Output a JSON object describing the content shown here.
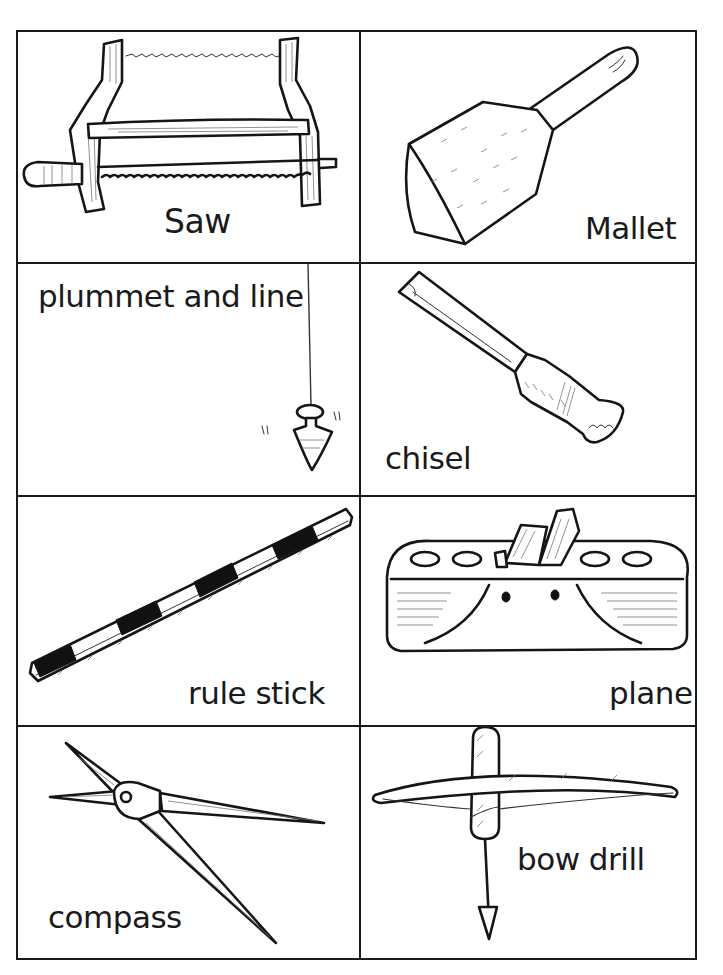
{
  "worksheet": {
    "layout": {
      "columns": 2,
      "rows": 4
    },
    "cards": [
      {
        "id": "saw",
        "label": "Saw",
        "icon": "bow-saw-icon"
      },
      {
        "id": "mallet",
        "label": "Mallet",
        "icon": "mallet-icon"
      },
      {
        "id": "plummet",
        "label": "plummet and line",
        "icon": "plumb-bob-icon"
      },
      {
        "id": "chisel",
        "label": "chisel",
        "icon": "chisel-icon"
      },
      {
        "id": "rule-stick",
        "label": "rule stick",
        "icon": "rule-stick-icon"
      },
      {
        "id": "plane",
        "label": "plane",
        "icon": "wood-plane-icon"
      },
      {
        "id": "compass",
        "label": "compass",
        "icon": "compass-divider-icon"
      },
      {
        "id": "bow-drill",
        "label": "bow drill",
        "icon": "bow-drill-icon"
      }
    ],
    "colors": {
      "ink": "#151515",
      "paper": "#ffffff"
    }
  }
}
